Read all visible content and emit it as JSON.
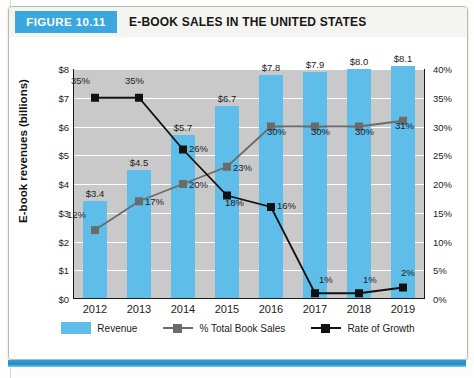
{
  "figure": {
    "badge_label": "FIGURE 10.11",
    "title": "E-BOOK SALES IN THE UNITED STATES",
    "badge_color": "#3aa8dd"
  },
  "legend": {
    "items": [
      {
        "label": "Revenue",
        "type": "bar",
        "color": "#5fbdea"
      },
      {
        "label": "% Total Book Sales",
        "type": "line",
        "color": "#6b6b6b"
      },
      {
        "label": "Rate of Growth",
        "type": "line",
        "color": "#111111"
      }
    ]
  },
  "chart_data": {
    "type": "bar",
    "title": "E-BOOK SALES IN THE UNITED STATES",
    "xlabel": "",
    "ylabel": "E-book revenues  (billions)",
    "y2label": "",
    "categories": [
      "2012",
      "2013",
      "2014",
      "2015",
      "2016",
      "2017",
      "2018",
      "2019"
    ],
    "ylim": [
      0,
      8
    ],
    "yticks": [
      "$0",
      "$1",
      "$2",
      "$3",
      "$4",
      "$5",
      "$6",
      "$7",
      "$8"
    ],
    "ytick_values": [
      0,
      1,
      2,
      3,
      4,
      5,
      6,
      7,
      8
    ],
    "y2lim": [
      0,
      40
    ],
    "y2ticks": [
      "0%",
      "5%",
      "10%",
      "15%",
      "20%",
      "25%",
      "30%",
      "35%",
      "40%"
    ],
    "y2tick_values": [
      0,
      5,
      10,
      15,
      20,
      25,
      30,
      35,
      40
    ],
    "grid": true,
    "legend_position": "bottom",
    "series": [
      {
        "name": "Revenue",
        "type": "bar",
        "axis": "left",
        "color": "#5fbdea",
        "values": [
          3.4,
          4.5,
          5.7,
          6.7,
          7.8,
          7.9,
          8.0,
          8.1
        ],
        "labels": [
          "$3.4",
          "$4.5",
          "$5.7",
          "$6.7",
          "$7.8",
          "$7.9",
          "$8.0",
          "$8.1"
        ]
      },
      {
        "name": "% Total Book Sales",
        "type": "line",
        "axis": "right",
        "color": "#6b6b6b",
        "values": [
          12,
          17,
          20,
          23,
          30,
          30,
          30,
          31
        ],
        "labels": [
          "12%",
          "17%",
          "20%",
          "23%",
          "30%",
          "30%",
          "30%",
          "31%"
        ]
      },
      {
        "name": "Rate of Growth",
        "type": "line",
        "axis": "right",
        "color": "#111111",
        "values": [
          35,
          35,
          26,
          18,
          16,
          1,
          1,
          2
        ],
        "labels": [
          "35%",
          "35%",
          "26%",
          "18%",
          "16%",
          "1%",
          "1%",
          "2%"
        ]
      }
    ]
  }
}
